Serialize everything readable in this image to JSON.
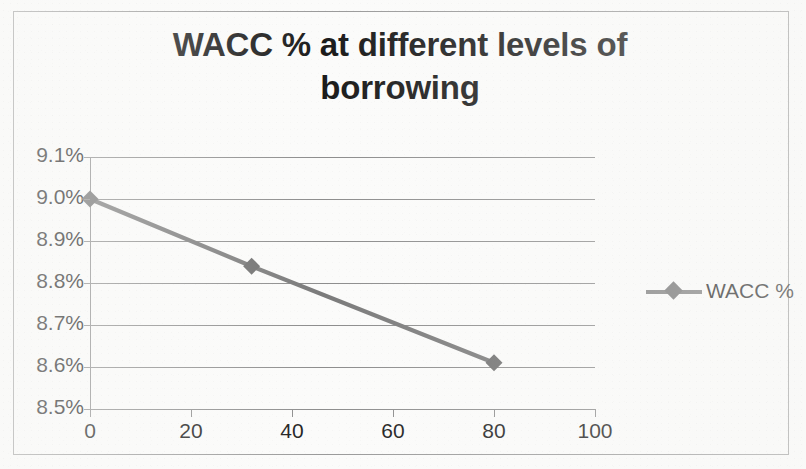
{
  "chart_data": {
    "type": "line",
    "title": "WACC % at different levels of borrowing",
    "xlabel": "",
    "ylabel": "",
    "xlim": [
      0,
      100
    ],
    "ylim": [
      8.5,
      9.1
    ],
    "grid": true,
    "legend_position": "right",
    "x_ticks": [
      "0",
      "20",
      "40",
      "60",
      "80",
      "100"
    ],
    "x_tick_values": [
      0,
      20,
      40,
      60,
      80,
      100
    ],
    "y_ticks": [
      "8.5%",
      "8.6%",
      "8.7%",
      "8.8%",
      "8.9%",
      "9.0%",
      "9.1%"
    ],
    "y_tick_values": [
      8.5,
      8.6,
      8.7,
      8.8,
      8.9,
      9.0,
      9.1
    ],
    "series": [
      {
        "name": "WACC %",
        "color": "#7b7b7b",
        "marker": "diamond",
        "x": [
          0,
          32,
          80
        ],
        "y": [
          9.0,
          8.84,
          8.61
        ],
        "points": [
          {
            "x": 0,
            "y": 9.0,
            "label": "9.00%"
          },
          {
            "x": 32,
            "y": 8.84,
            "label": "8.84%"
          },
          {
            "x": 80,
            "y": 8.61,
            "label": "8.61%"
          }
        ]
      }
    ]
  },
  "legend": {
    "entries": [
      {
        "label": "WACC %",
        "color": "#7b7b7b",
        "marker": "diamond"
      }
    ]
  },
  "colors": {
    "series_line": "#7b7b7b",
    "marker_fill": "#6f6f6f",
    "gridline": "#8d8d8d",
    "axis": "#8d8d8d",
    "frame_border": "#9a9a9a",
    "title_text": "#1b1b1b",
    "tick_text": "#1d1d1d",
    "background": "#fbfbfa"
  }
}
